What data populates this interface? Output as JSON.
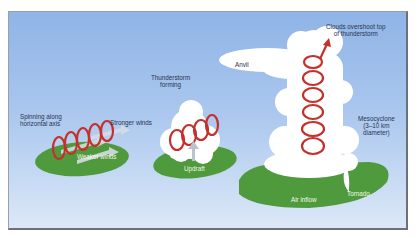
{
  "diagram": {
    "colors": {
      "sky_top": "#8fb4e6",
      "sky_bottom": "#dde8f7",
      "ground": "#4f9a3c",
      "cloud": "#ffffff",
      "spiral": "#c4302b",
      "label_dark": "#2a3550",
      "label_light": "#f3f8e8"
    },
    "stages": [
      {
        "id": "stage-1",
        "labels": {
          "spinning": "Spinning along horizontal axis",
          "spinning_line1": "Spinning along",
          "spinning_line2": "horizontal axis",
          "stronger": "Stronger winds",
          "weaker": "Weaker winds"
        }
      },
      {
        "id": "stage-2",
        "labels": {
          "title_line1": "Thunderstorm",
          "title_line2": "forming",
          "updraft": "Updraft"
        }
      },
      {
        "id": "stage-3",
        "labels": {
          "overshoot_line1": "Clouds overshoot top",
          "overshoot_line2": "of thunderstorm",
          "anvil": "Anvil",
          "meso_line1": "Mesocyclone",
          "meso_line2": "(3–10 km",
          "meso_line3": "diameter)",
          "inflow": "Air inflow",
          "tornado": "Tornado"
        }
      }
    ]
  }
}
